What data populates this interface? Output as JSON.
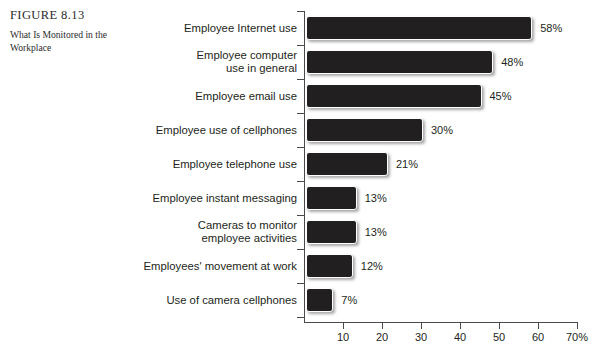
{
  "caption": {
    "figure_number": "FIGURE 8.13",
    "title": "What Is Monitored in the Workplace"
  },
  "chart_data": {
    "type": "bar",
    "orientation": "horizontal",
    "title": "What Is Monitored in the Workplace",
    "xlabel": "",
    "ylabel": "",
    "xlim": [
      0,
      70
    ],
    "grid": false,
    "legend": null,
    "axis_tick_labels": [
      "10",
      "20",
      "30",
      "40",
      "50",
      "60",
      "70%"
    ],
    "axis_ticks": [
      10,
      20,
      30,
      40,
      50,
      60,
      70
    ],
    "categories": [
      "Employee Internet use",
      "Employee computer use in general",
      "Employee email use",
      "Employee use of cellphones",
      "Employee telephone use",
      "Employee instant messaging",
      "Cameras to monitor employee activities",
      "Employees' movement at work",
      "Use of camera cellphones"
    ],
    "values": [
      58,
      48,
      45,
      30,
      21,
      13,
      13,
      12,
      7
    ],
    "value_labels": [
      "58%",
      "48%",
      "45%",
      "30%",
      "21%",
      "13%",
      "13%",
      "12%",
      "7%"
    ],
    "bar_color": "#211f20"
  },
  "rows": [
    {
      "label_lines": [
        "Employee Internet use"
      ],
      "value": 58,
      "value_label": "58%"
    },
    {
      "label_lines": [
        "Employee computer",
        "use in general"
      ],
      "value": 48,
      "value_label": "48%"
    },
    {
      "label_lines": [
        "Employee email use"
      ],
      "value": 45,
      "value_label": "45%"
    },
    {
      "label_lines": [
        "Employee use of cellphones"
      ],
      "value": 30,
      "value_label": "30%"
    },
    {
      "label_lines": [
        "Employee telephone use"
      ],
      "value": 21,
      "value_label": "21%"
    },
    {
      "label_lines": [
        "Employee instant messaging"
      ],
      "value": 13,
      "value_label": "13%"
    },
    {
      "label_lines": [
        "Cameras to monitor",
        "employee activities"
      ],
      "value": 13,
      "value_label": "13%"
    },
    {
      "label_lines": [
        "Employees' movement at work"
      ],
      "value": 12,
      "value_label": "12%"
    },
    {
      "label_lines": [
        "Use of camera cellphones"
      ],
      "value": 7,
      "value_label": "7%"
    }
  ]
}
